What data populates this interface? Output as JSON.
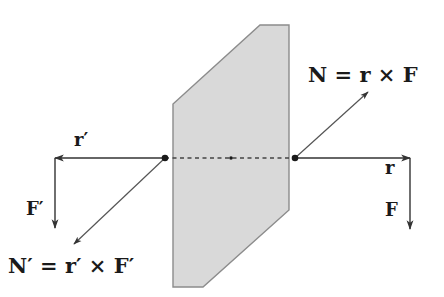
{
  "diagram": {
    "plane": {
      "fill": "#d9d9d9",
      "edge": "#8c8c8c",
      "points": [
        [
          260,
          25
        ],
        [
          289,
          25
        ],
        [
          289,
          210
        ],
        [
          203,
          287
        ],
        [
          173,
          287
        ],
        [
          173,
          104
        ]
      ]
    },
    "points": {
      "left_dot": [
        165,
        158
      ],
      "center_dot": [
        231,
        158
      ],
      "right_dot": [
        295,
        158
      ]
    },
    "arrows": {
      "r": {
        "from": [
          295,
          158
        ],
        "to": [
          410,
          158
        ],
        "label": "r"
      },
      "F": {
        "from": [
          410,
          158
        ],
        "to": [
          410,
          229
        ],
        "label": "F"
      },
      "r_prime": {
        "from": [
          165,
          158
        ],
        "to": [
          55,
          158
        ],
        "label": "r′"
      },
      "F_prime": {
        "from": [
          55,
          158
        ],
        "to": [
          55,
          228
        ],
        "label": "F′"
      },
      "N": {
        "from": [
          295,
          158
        ],
        "to": [
          368,
          92
        ]
      },
      "N_prime": {
        "from": [
          165,
          158
        ],
        "to": [
          74,
          244
        ]
      }
    },
    "labels": {
      "torque_eq": "N = r × F",
      "torque_eq_prime": "N′ = r′ × F′",
      "r": "r",
      "F": "F",
      "r_prime": "r′",
      "F_prime": "F′"
    },
    "colors": {
      "arrow": "#333333",
      "dashed_line": "#444444"
    }
  }
}
